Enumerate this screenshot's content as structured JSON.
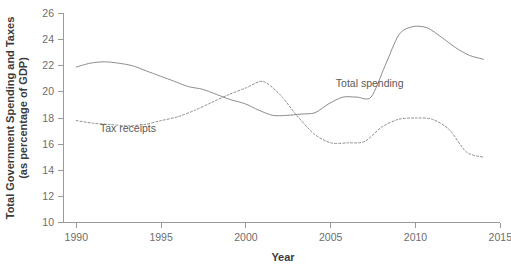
{
  "chart_data": {
    "type": "line",
    "title": "",
    "xlabel": "Year",
    "ylabel": "Total Government Spending and Taxes (as percentage of GDP)",
    "ylabel_line1": "Total Government Spending and Taxes",
    "ylabel_line2": "(as percentage of GDP)",
    "xlim": [
      1990,
      2015
    ],
    "ylim": [
      10,
      26
    ],
    "xticks": [
      1990,
      1995,
      2000,
      2005,
      2010,
      2015
    ],
    "yticks": [
      10,
      12,
      14,
      16,
      18,
      20,
      22,
      24,
      26
    ],
    "xtick_labels": [
      "1990",
      "1995",
      "2000",
      "2005",
      "2010",
      "2015"
    ],
    "ytick_labels": [
      "10",
      "12",
      "14",
      "16",
      "18",
      "20",
      "22",
      "24",
      "26"
    ],
    "grid": false,
    "legend_position": "inline-annotation",
    "x": [
      1990,
      1991,
      1992,
      1993,
      1994,
      1995,
      1996,
      1997,
      1998,
      1999,
      2000,
      2001,
      2002,
      2003,
      2004,
      2005,
      2006,
      2007,
      2008,
      2009,
      2010,
      2011,
      2012,
      2013,
      2014
    ],
    "series": [
      {
        "name": "Total spending",
        "style": "solid",
        "color": "#8c8c8c",
        "annotation": "Total spending",
        "values": [
          21.9,
          22.2,
          22.3,
          22.2,
          22.0,
          21.6,
          21.2,
          20.8,
          20.4,
          20.2,
          19.8,
          19.4,
          19.1,
          18.6,
          18.2,
          18.2,
          18.2,
          18.2,
          19.0,
          19.6,
          19.6,
          19.5,
          19.5,
          19.6,
          25.0
        ],
        "values_true": [
          21.9,
          22.2,
          22.3,
          22.2,
          22.0,
          21.6,
          21.2,
          20.8,
          20.4,
          20.2,
          19.8,
          19.4,
          19.1,
          18.6,
          18.2,
          18.2,
          18.3,
          18.4,
          19.1,
          19.6,
          19.6,
          19.6,
          22.0,
          24.4,
          25.0
        ]
      },
      {
        "name": "Tax receipts",
        "style": "dotted",
        "color": "#8c8c8c",
        "annotation": "Tax receipts",
        "values": [
          17.8,
          17.6,
          17.5,
          17.4,
          17.5,
          17.8,
          18.1,
          18.6,
          19.2,
          19.8,
          20.3,
          20.8,
          19.8,
          18.2,
          16.8,
          16.1,
          16.1,
          16.2,
          17.3,
          17.9,
          18.0,
          17.9,
          17.1,
          15.4,
          15.0
        ]
      }
    ],
    "series_spending_y": [
      21.9,
      22.2,
      22.3,
      22.2,
      22.0,
      21.6,
      21.2,
      20.8,
      20.4,
      20.2,
      19.8,
      19.4,
      19.1,
      18.6,
      18.2,
      18.2,
      18.3,
      18.4,
      19.1,
      19.6,
      19.6,
      19.6,
      22.0,
      24.4,
      25.0,
      24.9,
      24.2,
      23.4,
      22.8,
      22.5
    ],
    "annotations": [
      {
        "text": "Total spending",
        "x": 2005.3,
        "y": 20.4
      },
      {
        "text": "Tax receipts",
        "x": 1991.4,
        "y": 16.9
      }
    ]
  },
  "axis": {
    "x_title": "Year",
    "y_title_line1": "Total Government Spending and Taxes",
    "y_title_line2": "(as percentage of GDP)"
  },
  "colors": {
    "line": "#8c8c8c",
    "axis": "#9a9a9a",
    "text": "#4a4a4a",
    "tick_text": "#6d6d6d",
    "background": "#ffffff"
  }
}
